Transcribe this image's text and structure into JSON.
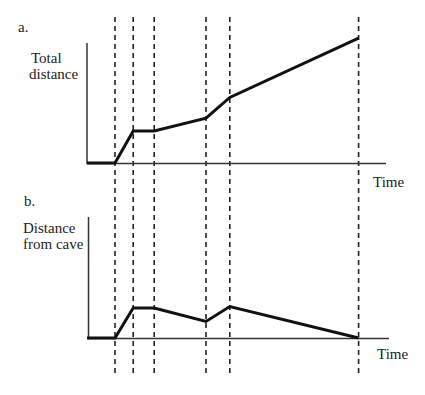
{
  "chart_data": [
    {
      "panel": "a.",
      "type": "line",
      "title": "",
      "ylabel": [
        "Total",
        "distance"
      ],
      "xlabel": "Time",
      "grid": false,
      "legend": null,
      "x": [
        0,
        1.0,
        1.65,
        2.4,
        4.25,
        5.1,
        9.7
      ],
      "values": [
        0,
        0,
        1.0,
        1.0,
        1.4,
        2.05,
        3.9
      ],
      "units": "relative (no tick labels shown)"
    },
    {
      "panel": "b.",
      "type": "line",
      "title": "",
      "ylabel": [
        "Distance",
        "from cave"
      ],
      "xlabel": "Time",
      "grid": false,
      "legend": null,
      "x": [
        0,
        1.0,
        1.65,
        2.4,
        4.25,
        5.1,
        9.7
      ],
      "values": [
        0,
        0,
        1.0,
        1.0,
        0.55,
        1.05,
        0
      ],
      "units": "relative (no tick labels shown)"
    }
  ],
  "shared": {
    "vertical_dashed_lines_at_x": [
      1.0,
      1.65,
      2.4,
      4.25,
      5.1,
      9.7
    ]
  },
  "panels": {
    "a": {
      "tag": "a.",
      "ylabel_line1": "Total",
      "ylabel_line2": "distance",
      "xlabel": "Time"
    },
    "b": {
      "tag": "b.",
      "ylabel_line1": "Distance",
      "ylabel_line2": "from cave",
      "xlabel": "Time"
    }
  },
  "colors": {
    "line": "#111111",
    "axis": "#333333",
    "text": "#222222"
  }
}
